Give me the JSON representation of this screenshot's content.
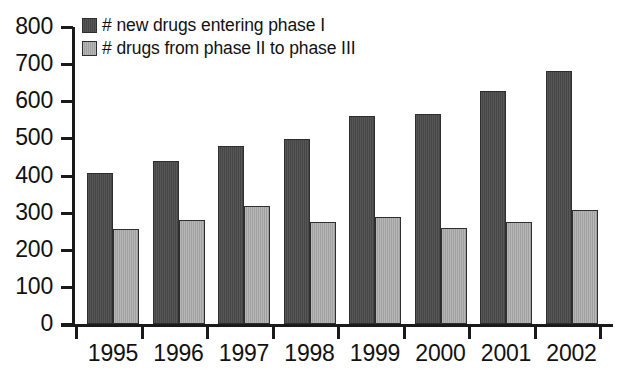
{
  "chart_data": {
    "type": "bar",
    "title": "",
    "subtitle": "",
    "xlabel": "",
    "ylabel": "",
    "categories": [
      "1995",
      "1996",
      "1997",
      "1998",
      "1999",
      "2000",
      "2001",
      "2002"
    ],
    "series": [
      {
        "name": "# new drugs entering phase I",
        "color": "#4a4a4a",
        "values": [
          407,
          439,
          479,
          498,
          560,
          567,
          628,
          681
        ]
      },
      {
        "name": "# drugs from phase II to phase III",
        "color": "#a9a9a9",
        "values": [
          256,
          279,
          318,
          275,
          287,
          258,
          276,
          307
        ]
      }
    ],
    "ylim": [
      0,
      800
    ],
    "ytick_labels": [
      "800",
      "700",
      "600",
      "500",
      "400",
      "300",
      "200",
      "100",
      "0"
    ],
    "ytick_values": [
      800,
      700,
      600,
      500,
      400,
      300,
      200,
      100,
      0
    ],
    "grid": false,
    "legend_position": "top-left",
    "annotations": []
  },
  "axis": {
    "line_color": "#1a1a1a"
  }
}
